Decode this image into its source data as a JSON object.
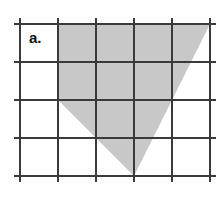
{
  "figure": {
    "label": "a.",
    "label_position": {
      "x": 29,
      "y": 43
    },
    "width": 219,
    "height": 198,
    "background_color": "#ffffff"
  },
  "grid": {
    "line_color": "#3a3a3a",
    "line_width": 2.2,
    "columns": 5,
    "rows": 4,
    "cell_size": 38,
    "overhang": 6,
    "vertical_line_x": [
      20,
      58,
      96,
      134,
      172,
      210
    ],
    "horizontal_line_y": [
      24,
      62,
      100,
      138,
      176
    ]
  },
  "shape": {
    "name": "shaded-polygon",
    "fill_color": "#c8c8c8",
    "vertices": [
      {
        "x": 58,
        "y": 24
      },
      {
        "x": 210,
        "y": 24
      },
      {
        "x": 134,
        "y": 176
      },
      {
        "x": 58,
        "y": 100
      }
    ],
    "points_string": "58,24 210,24 134,176 58,100"
  },
  "chart_data": {
    "type": "table",
    "title": "a.",
    "xlabel": "",
    "ylabel": "",
    "grid": true,
    "categories": [
      "grid-columns",
      "grid-rows",
      "cell-size-px"
    ],
    "values": [
      5,
      4,
      38
    ],
    "annotations": [
      "Shaded quadrilateral on a 5 by 4 unit square grid",
      "Vertices at grid units (1,0), (5,0), (3,4), (1,2) measured from the top-left grid corner"
    ]
  }
}
